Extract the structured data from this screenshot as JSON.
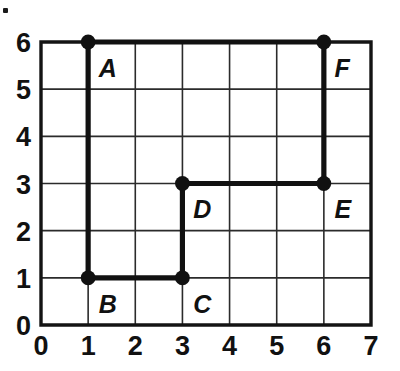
{
  "figure": {
    "title": "",
    "artifact_mark": "·"
  },
  "chart_data": {
    "type": "scatter",
    "title": "",
    "xlabel": "",
    "ylabel": "",
    "xlim": [
      0,
      7
    ],
    "ylim": [
      0,
      6
    ],
    "xticks": [
      "0",
      "1",
      "2",
      "3",
      "4",
      "5",
      "6",
      "7"
    ],
    "yticks": [
      "0",
      "1",
      "2",
      "3",
      "4",
      "5",
      "6"
    ],
    "grid": true,
    "legend": "none",
    "points": [
      {
        "label": "A",
        "x": 1,
        "y": 6,
        "label_dx": 0.1,
        "label_dy": -0.55
      },
      {
        "label": "B",
        "x": 1,
        "y": 1,
        "label_dx": 0.1,
        "label_dy": -0.55
      },
      {
        "label": "C",
        "x": 3,
        "y": 1,
        "label_dx": 0.1,
        "label_dy": -0.55
      },
      {
        "label": "D",
        "x": 3,
        "y": 3,
        "label_dx": 0.1,
        "label_dy": -0.55
      },
      {
        "label": "E",
        "x": 6,
        "y": 3,
        "label_dx": 0.1,
        "label_dy": -0.55
      },
      {
        "label": "F",
        "x": 6,
        "y": 6,
        "label_dx": 0.1,
        "label_dy": -0.55
      }
    ],
    "path_segments": [
      {
        "name": "A-F",
        "from": "A",
        "to": "F",
        "x1": 1,
        "y1": 6,
        "x2": 6,
        "y2": 6
      },
      {
        "name": "A-B",
        "from": "A",
        "to": "B",
        "x1": 1,
        "y1": 6,
        "x2": 1,
        "y2": 1
      },
      {
        "name": "B-C",
        "from": "B",
        "to": "C",
        "x1": 1,
        "y1": 1,
        "x2": 3,
        "y2": 1
      },
      {
        "name": "C-D",
        "from": "C",
        "to": "D",
        "x1": 3,
        "y1": 1,
        "x2": 3,
        "y2": 3
      },
      {
        "name": "D-E",
        "from": "D",
        "to": "E",
        "x1": 3,
        "y1": 3,
        "x2": 6,
        "y2": 3
      },
      {
        "name": "E-F",
        "from": "E",
        "to": "F",
        "x1": 6,
        "y1": 3,
        "x2": 6,
        "y2": 6
      }
    ],
    "colors": {
      "path": "#111111",
      "vertex": "#111111",
      "grid": "#2b2b2b",
      "axis": "#141414",
      "text": "#111111",
      "background": "#ffffff"
    }
  }
}
